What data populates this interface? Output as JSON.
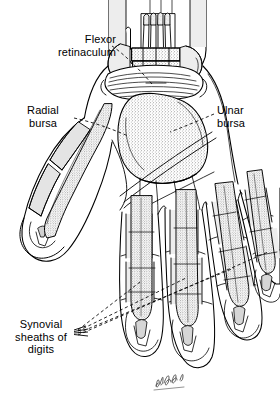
{
  "figure": {
    "background_color": "#ffffff",
    "ink_color": "#000000",
    "fill_light": "#e8e8e8",
    "stipple_color": "#6b6b6b",
    "width": 280,
    "height": 404
  },
  "labels": {
    "flexor_retinaculum": "Flexor\nretinaculum",
    "radial_bursa": "Radial\nbursa",
    "ulnar_bursa": "Ulnar\nbursa",
    "synovial_sheaths": "Synovial\nsheaths of\ndigits"
  },
  "signature": {
    "text": "artist-signature",
    "visible": true
  },
  "structures": [
    {
      "name": "forearm-flexor-tendons",
      "description": "Cut flexor tendons entering wrist at top"
    },
    {
      "name": "flexor-retinaculum",
      "description": "Transverse fibrous band across the wrist"
    },
    {
      "name": "radial-bursa",
      "description": "Flexor pollicis longus synovial sheath along thumb"
    },
    {
      "name": "ulnar-bursa",
      "description": "Common flexor synovial sheath in palm, stippled"
    },
    {
      "name": "digital-synovial-sheaths",
      "description": "Four digital tendon sheaths of fingers 2-5"
    },
    {
      "name": "thumb",
      "description": "Abducted thumb, lateral to palm"
    },
    {
      "name": "hand-outline",
      "description": "Palmar outline of hand and fingers"
    }
  ]
}
